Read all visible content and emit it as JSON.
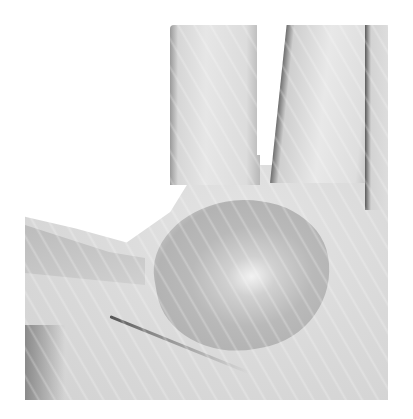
{
  "image": {
    "description": "Grayscale clinical photograph of an open palm showing a darker oval patch in the center of the palm",
    "colors": {
      "background": "#ffffff",
      "skin_light": "#e4e4e4",
      "skin_mid": "#d0d0d0",
      "patch": "#b5b5b5",
      "shadow": "#6f6f6f"
    }
  }
}
